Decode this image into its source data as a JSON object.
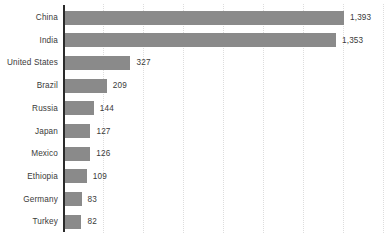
{
  "chart_data": {
    "type": "bar",
    "orientation": "horizontal",
    "title": "",
    "subtitle": "",
    "xlabel": "",
    "ylabel": "",
    "categories": [
      "China",
      "India",
      "United States",
      "Brazil",
      "Russia",
      "Japan",
      "Mexico",
      "Ethiopia",
      "Germany",
      "Turkey"
    ],
    "values": [
      1393,
      1353,
      327,
      209,
      144,
      127,
      126,
      109,
      83,
      82
    ],
    "value_labels": [
      "1,393",
      "1,353",
      "327",
      "209",
      "144",
      "127",
      "126",
      "109",
      "83",
      "82"
    ],
    "xlim": [
      0,
      1600
    ],
    "gridline_values": [
      200,
      400,
      600,
      800,
      1000,
      1200,
      1400,
      1600
    ],
    "grid": true,
    "grid_style": "dotted-vertical",
    "legend": "none",
    "data_labels": true,
    "axis_tick_labels": [],
    "colors": {
      "bar": "#8a8a8a",
      "axis": "#2b2b2b",
      "gridline": "#dddddd",
      "text": "#3a3a3a",
      "background": "#ffffff"
    }
  }
}
